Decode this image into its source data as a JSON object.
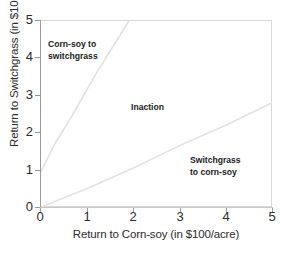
{
  "chart_data": {
    "type": "line",
    "title": "",
    "xlabel": "Return to Corn-soy (in $100/acre)",
    "ylabel": "Return to Switchgrass (in $100/acre)",
    "xlim": [
      0,
      5
    ],
    "ylim": [
      0,
      5
    ],
    "xticks": [
      "0",
      "1",
      "2",
      "3",
      "4",
      "5"
    ],
    "yticks": [
      "0",
      "1",
      "2",
      "3",
      "4",
      "5"
    ],
    "grid": false,
    "legend": "none",
    "line_color": "#e2e2e2",
    "series": [
      {
        "name": "upper-threshold",
        "points": [
          [
            0,
            0.95
          ],
          [
            0.3,
            1.7
          ],
          [
            0.6,
            2.3
          ],
          [
            0.9,
            2.95
          ],
          [
            1.2,
            3.6
          ],
          [
            1.5,
            4.2
          ],
          [
            1.9,
            5.0
          ]
        ]
      },
      {
        "name": "lower-threshold",
        "points": [
          [
            0,
            0.0
          ],
          [
            1.0,
            0.5
          ],
          [
            2.0,
            1.05
          ],
          [
            3.0,
            1.65
          ],
          [
            4.0,
            2.2
          ],
          [
            5.0,
            2.8
          ]
        ]
      }
    ],
    "annotations": [
      {
        "text": "Corn-soy to\nswitchgrass",
        "x": 0.2,
        "y": 4.5
      },
      {
        "text": "Inaction",
        "x": 2.0,
        "y": 2.85
      },
      {
        "text": "Switchgrass\nto corn-soy",
        "x": 3.3,
        "y": 1.4
      }
    ]
  }
}
